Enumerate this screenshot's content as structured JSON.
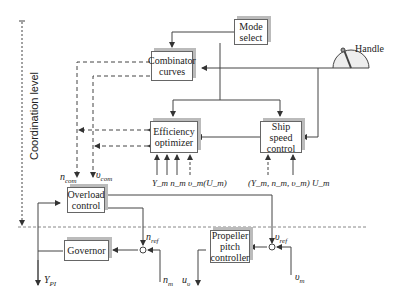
{
  "axis_label": "Coordination level",
  "blocks": {
    "mode_select": "Mode select",
    "combinator": "Combinator curves",
    "efficiency": "Efficiency optimizer",
    "ship_speed": "Ship speed control",
    "overload": "Overload control",
    "governor": "Governor",
    "propeller": "Propeller pitch controller"
  },
  "handle_label": "Handle",
  "signals": {
    "n_com": "n",
    "n_com_sub": "com",
    "v_com": "υ",
    "v_com_sub": "com",
    "eff_inputs": "Y_m n_m υ_m(U_m)",
    "speed_inputs": "(Y_m, n_m, υ_m) U_m",
    "n_ref": "n",
    "n_ref_sub": "ref",
    "v_ref": "υ",
    "v_ref_sub": "ref",
    "y_pi": "Y",
    "y_pi_sub": "PI",
    "n_m": "n",
    "n_m_sub": "m",
    "u_v": "u",
    "u_v_sub": "υ",
    "v_m": "υ",
    "v_m_sub": "m"
  },
  "colors": {
    "line": "#444444",
    "shadow": "#bbbbbb"
  }
}
